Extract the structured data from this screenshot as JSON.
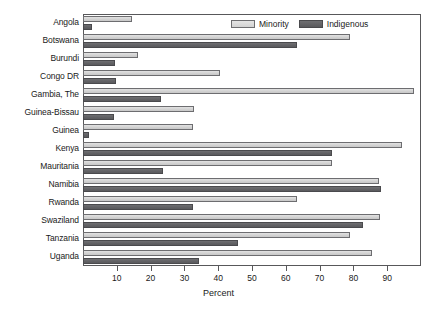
{
  "chart_data": {
    "type": "bar",
    "orientation": "horizontal",
    "title": "",
    "xlabel": "Percent",
    "ylabel": "",
    "xlim": [
      0,
      100
    ],
    "xticks": [
      10,
      20,
      30,
      40,
      50,
      60,
      70,
      80,
      90
    ],
    "grid": false,
    "legend_position": "top-right",
    "categories": [
      "Angola",
      "Botswana",
      "Burundi",
      "Congo DR",
      "Gambia, The",
      "Guinea-Bissau",
      "Guinea",
      "Kenya",
      "Mauritania",
      "Namibia",
      "Rwanda",
      "Swaziland",
      "Tanzania",
      "Uganda"
    ],
    "series": [
      {
        "name": "Minority",
        "color": "#d2d2d2",
        "values": [
          14.4,
          79.0,
          16.4,
          40.5,
          98.0,
          32.8,
          32.5,
          94.5,
          73.8,
          87.5,
          63.2,
          87.8,
          79.0,
          85.5
        ]
      },
      {
        "name": "Indigenous",
        "color": "#62626 5",
        "values": [
          2.6,
          63.2,
          9.5,
          9.8,
          23.0,
          9.2,
          1.7,
          73.8,
          23.6,
          88.2,
          32.5,
          82.8,
          46.0,
          34.2
        ]
      }
    ]
  },
  "axis": {
    "x_title": "Percent"
  },
  "legend": {
    "items": [
      {
        "label": "Minority",
        "swatch": "light-gray-swatch"
      },
      {
        "label": "Indigenous",
        "swatch": "dark-gray-swatch"
      }
    ]
  },
  "colors": {
    "minority": "#d2d2d2",
    "indigenous": "#626265",
    "frame": "#58585a",
    "text": "#1a1a1a",
    "background": "#ffffff"
  }
}
